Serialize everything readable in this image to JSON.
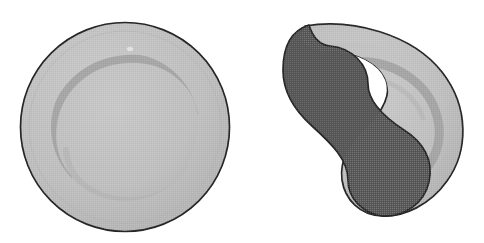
{
  "figure": {
    "title": "Plate shape deformation comparison",
    "canvas": {
      "width": 484,
      "height": 243,
      "background": "#ffffff"
    },
    "panel_count": 2
  },
  "colors": {
    "background": "#ffffff",
    "plate_rim_fill": "#b9b9b9",
    "plate_well_fill": "#c2c2c2",
    "plate_well_shadow": "#a5a5a5",
    "plate_outline": "#262626",
    "deformed_light_fill": "#b9b9b9",
    "deformed_well_fill": "#c2c2c2",
    "deformed_well_shadow": "#a3a3a3",
    "deformed_dark_fill": "#575757",
    "deformed_outline": "#262626",
    "highlight": "#d4d4d4"
  },
  "panels": [
    {
      "id": "left-panel",
      "label": "Undeformed plate",
      "shape_kind": "circle",
      "geometry": {
        "center_x": 125,
        "center_y": 127,
        "radius_outer": 105,
        "radius_well": 72,
        "bbox": [
          21,
          21,
          230,
          233
        ]
      },
      "parts": [
        {
          "name": "plate-rim",
          "fill": "#b9b9b9",
          "stroke": "#262626",
          "stroke_width": 1.6
        },
        {
          "name": "plate-well",
          "fill": "#c2c2c2",
          "stroke": "none"
        },
        {
          "name": "plate-well-shadow-arc",
          "fill": "none",
          "stroke": "#a5a5a5",
          "stroke_width": 7
        },
        {
          "name": "plate-specular-highlight",
          "fill": "#d6d6d6",
          "stroke": "none"
        }
      ]
    },
    {
      "id": "right-panel",
      "label": "Deformed plate with overlapping region",
      "shape_kind": "crescent",
      "geometry": {
        "bbox": [
          283,
          22,
          463,
          217
        ],
        "dark_region_bbox": [
          283,
          40,
          430,
          217
        ]
      },
      "parts": [
        {
          "name": "deformed-plate-body",
          "fill": "#b9b9b9",
          "stroke": "#262626",
          "stroke_width": 1.6
        },
        {
          "name": "deformed-plate-well",
          "fill": "#c2c2c2",
          "stroke": "none"
        },
        {
          "name": "deformed-well-shadow-arc",
          "fill": "none",
          "stroke": "#a3a3a3",
          "stroke_width": 8
        },
        {
          "name": "deformed-dark-overlap-region",
          "fill": "#575757",
          "stroke": "#262626",
          "stroke_width": 1.6
        }
      ]
    }
  ],
  "annotations": {
    "labels": [],
    "caption": ""
  }
}
